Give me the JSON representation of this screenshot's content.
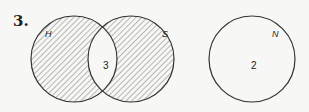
{
  "problem_number": "3.",
  "diagram": {
    "venn_pair": {
      "sets": [
        {
          "label": "H",
          "shaded": true
        },
        {
          "label": "S",
          "shaded": true
        }
      ],
      "intersection_value": "3",
      "intersection_shaded": false
    },
    "separate_set": {
      "label": "N",
      "value": "2",
      "shaded": false
    }
  }
}
